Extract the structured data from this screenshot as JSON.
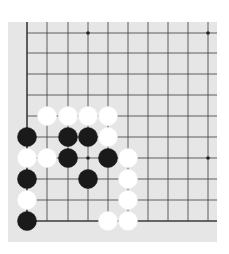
{
  "board": {
    "description": "Go board diagram, bottom-left corner region",
    "background_color": "#e6e6e6",
    "line_color": "#3a3a3a",
    "bounds": {
      "x": 8,
      "y": 22,
      "width": 209,
      "height": 220
    },
    "columns_x": [
      27,
      47,
      68,
      88,
      108,
      128,
      148,
      168,
      188,
      208
    ],
    "rows_y": [
      33,
      53,
      74,
      95,
      116,
      137,
      158,
      179,
      200,
      221
    ],
    "edges": {
      "left": true,
      "bottom": true,
      "top": false,
      "right": false
    },
    "star_points": [
      {
        "col": 3,
        "row": 0
      },
      {
        "col": 9,
        "row": 0
      },
      {
        "col": 3,
        "row": 6
      },
      {
        "col": 9,
        "row": 6
      }
    ],
    "stone_radius": 9.5,
    "stones": [
      {
        "color": "white",
        "col": 1,
        "row": 4
      },
      {
        "color": "white",
        "col": 2,
        "row": 4
      },
      {
        "color": "white",
        "col": 3,
        "row": 4
      },
      {
        "color": "white",
        "col": 4,
        "row": 4
      },
      {
        "color": "black",
        "col": 0,
        "row": 5
      },
      {
        "color": "black",
        "col": 2,
        "row": 5
      },
      {
        "color": "black",
        "col": 3,
        "row": 5
      },
      {
        "color": "white",
        "col": 4,
        "row": 5
      },
      {
        "color": "white",
        "col": 0,
        "row": 6
      },
      {
        "color": "white",
        "col": 1,
        "row": 6
      },
      {
        "color": "black",
        "col": 2,
        "row": 6
      },
      {
        "color": "black",
        "col": 4,
        "row": 6
      },
      {
        "color": "white",
        "col": 5,
        "row": 6
      },
      {
        "color": "black",
        "col": 0,
        "row": 7
      },
      {
        "color": "black",
        "col": 3,
        "row": 7
      },
      {
        "color": "white",
        "col": 5,
        "row": 7
      },
      {
        "color": "white",
        "col": 0,
        "row": 8
      },
      {
        "color": "white",
        "col": 5,
        "row": 8
      },
      {
        "color": "black",
        "col": 0,
        "row": 9
      },
      {
        "color": "white",
        "col": 4,
        "row": 9
      },
      {
        "color": "white",
        "col": 5,
        "row": 9
      }
    ]
  }
}
